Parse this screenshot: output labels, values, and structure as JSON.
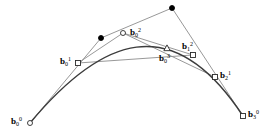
{
  "figure": {
    "width": 272,
    "height": 140,
    "background_color": "#ffffff",
    "curve_color": "#3c3c3c",
    "polygon_color": "#8c8c8c",
    "marker_stroke_color": "#2a2a2a",
    "filled_marker_color": "#000000",
    "label_color": "#000000"
  },
  "chart_data": {
    "type": "line",
    "xlabel": "",
    "ylabel": "",
    "xlim": [
      0,
      272
    ],
    "ylim": [
      140,
      0
    ],
    "grid": false,
    "legend": null,
    "curve": {
      "name": "cubic Bezier curve",
      "degree": 3,
      "control_points": [
        [
          30,
          123
        ],
        [
          101,
          38
        ],
        [
          172,
          8
        ],
        [
          243,
          116
        ]
      ],
      "color": "#3c3c3c"
    },
    "control_polygon": {
      "name": "control polygon",
      "vertices": [
        [
          30,
          123
        ],
        [
          101,
          38
        ],
        [
          172,
          8
        ],
        [
          243,
          116
        ]
      ],
      "color": "#8c8c8c"
    },
    "construction_levels": [
      {
        "level": 1,
        "name": "first de Casteljau level",
        "points": [
          [
            78,
            63
          ],
          [
            123,
            33
          ],
          [
            193,
            55
          ]
        ],
        "color": "#8c8c8c"
      },
      {
        "level": 2,
        "name": "second de Casteljau level",
        "points": [
          [
            103,
            46
          ],
          [
            167,
            48
          ]
        ],
        "color": "#8c8c8c"
      },
      {
        "level": 3,
        "name": "subdivision point on curve",
        "points": [
          [
            167,
            48
          ]
        ],
        "color": "#8c8c8c"
      }
    ],
    "series": [
      {
        "name": "cubic Bezier curve",
        "x": [
          30,
          52,
          76,
          101,
          128,
          155,
          180,
          205,
          225,
          243
        ],
        "y": [
          123,
          99,
          78,
          62,
          51,
          47,
          52,
          68,
          90,
          116
        ]
      }
    ]
  },
  "markers": [
    {
      "id": "b0-0",
      "shape": "circle-open",
      "x": 30,
      "y": 123,
      "size": 5,
      "label": {
        "base": "b",
        "sub": "0",
        "sup": "0"
      },
      "label_x": 11,
      "label_y": 116,
      "description": "start control point of the cubic Bezier curve"
    },
    {
      "id": "b1-0",
      "shape": "circle-filled",
      "x": 101,
      "y": 38,
      "size": 5,
      "label": null,
      "label_x": null,
      "label_y": null,
      "description": "second control point of the cubic Bezier curve"
    },
    {
      "id": "b2-0",
      "shape": "circle-filled",
      "x": 172,
      "y": 8,
      "size": 5,
      "label": null,
      "label_x": null,
      "label_y": null,
      "description": "third control point of the cubic Bezier curve"
    },
    {
      "id": "b3-0",
      "shape": "square-open",
      "x": 243,
      "y": 116,
      "size": 5,
      "label": {
        "base": "b",
        "sub": "3",
        "sup": "0"
      },
      "label_x": 248,
      "label_y": 109,
      "description": "end control point of the cubic Bezier curve"
    },
    {
      "id": "b0-1",
      "shape": "square-open",
      "x": 78,
      "y": 63,
      "size": 5,
      "label": {
        "base": "b",
        "sub": "0",
        "sup": "1"
      },
      "label_x": 60,
      "label_y": 56,
      "description": "first level de Casteljau point on segment b0-b1"
    },
    {
      "id": "b1-1",
      "shape": "circle-open",
      "x": 123,
      "y": 33,
      "size": 5,
      "label": null,
      "label_x": null,
      "label_y": null,
      "description": "first level de Casteljau point on segment b1-b2"
    },
    {
      "id": "b2-1",
      "shape": "square-open",
      "x": 215,
      "y": 77,
      "size": 5,
      "label": {
        "base": "b",
        "sub": "2",
        "sup": "1"
      },
      "label_x": 220,
      "label_y": 70,
      "description": "first level de Casteljau point on segment b2-b3"
    },
    {
      "id": "b0-2",
      "shape": "none",
      "x": 123,
      "y": 33,
      "size": 0,
      "label": {
        "base": "b",
        "sub": "0",
        "sup": "2"
      },
      "label_x": 130,
      "label_y": 27,
      "description": "second level de Casteljau point label"
    },
    {
      "id": "b1-2",
      "shape": "square-open",
      "x": 193,
      "y": 55,
      "size": 5,
      "label": {
        "base": "b",
        "sub": "1",
        "sup": "2"
      },
      "label_x": 182,
      "label_y": 41,
      "description": "second level de Casteljau point on the right half"
    },
    {
      "id": "b0-3",
      "shape": "triangle-open",
      "x": 167,
      "y": 48,
      "size": 5,
      "label": {
        "base": "b",
        "sub": "0",
        "sup": "3"
      },
      "label_x": 159,
      "label_y": 53,
      "description": "subdivision point lying on the Bezier curve"
    }
  ],
  "segments": [
    {
      "name": "control-polygon-edge-1",
      "from": [
        30,
        123
      ],
      "to": [
        101,
        38
      ]
    },
    {
      "name": "control-polygon-edge-2",
      "from": [
        101,
        38
      ],
      "to": [
        172,
        8
      ]
    },
    {
      "name": "control-polygon-edge-3",
      "from": [
        172,
        8
      ],
      "to": [
        243,
        116
      ]
    },
    {
      "name": "level1-edge-1",
      "from": [
        78,
        63
      ],
      "to": [
        123,
        33
      ]
    },
    {
      "name": "level1-edge-2",
      "from": [
        123,
        33
      ],
      "to": [
        215,
        77
      ]
    },
    {
      "name": "level2-edge-1",
      "from": [
        78,
        63
      ],
      "to": [
        193,
        55
      ]
    },
    {
      "name": "level2-edge-2",
      "from": [
        123,
        33
      ],
      "to": [
        193,
        55
      ]
    }
  ]
}
